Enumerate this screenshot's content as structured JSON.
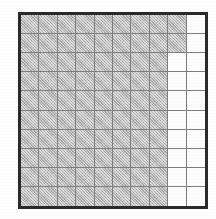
{
  "figure": {
    "kind": "grid-diagram"
  },
  "grid": {
    "rows": 10,
    "columns": 10,
    "cell_states": [
      [
        "filled",
        "filled",
        "filled",
        "filled",
        "filled",
        "filled",
        "filled",
        "filled",
        "filled",
        "empty"
      ],
      [
        "filled",
        "filled",
        "filled",
        "filled",
        "filled",
        "filled",
        "filled",
        "filled",
        "filled",
        "empty"
      ],
      [
        "filled",
        "filled",
        "filled",
        "filled",
        "filled",
        "filled",
        "filled",
        "filled",
        "empty",
        "empty"
      ],
      [
        "filled",
        "filled",
        "filled",
        "filled",
        "filled",
        "filled",
        "filled",
        "filled",
        "empty",
        "empty"
      ],
      [
        "filled",
        "filled",
        "filled",
        "filled",
        "filled",
        "filled",
        "filled",
        "filled",
        "empty",
        "empty"
      ],
      [
        "filled",
        "filled",
        "filled",
        "filled",
        "filled",
        "filled",
        "filled",
        "filled",
        "empty",
        "empty"
      ],
      [
        "filled",
        "filled",
        "filled",
        "filled",
        "filled",
        "filled",
        "filled",
        "filled",
        "empty",
        "empty"
      ],
      [
        "filled",
        "filled",
        "filled",
        "filled",
        "filled",
        "filled",
        "filled",
        "filled",
        "empty",
        "empty"
      ],
      [
        "filled",
        "filled",
        "filled",
        "filled",
        "filled",
        "filled",
        "filled",
        "filled",
        "empty",
        "empty"
      ],
      [
        "filled",
        "filled",
        "filled",
        "filled",
        "filled",
        "filled",
        "filled",
        "filled",
        "empty",
        "empty"
      ]
    ],
    "filled_count": 82,
    "empty_count": 18,
    "total_cells": 100
  },
  "colors": {
    "outer_border": "#2a2a2a",
    "grid_line": "#7e7e7e",
    "filled_cell": "#b9b9b9",
    "empty_cell": "#fdfdfd",
    "page_background": "#ffffff"
  }
}
